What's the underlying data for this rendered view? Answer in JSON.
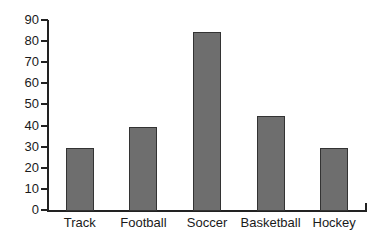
{
  "chart_data": {
    "type": "bar",
    "title": "",
    "subtitle": "",
    "xlabel": "",
    "ylabel": "",
    "categories": [
      "Track",
      "Football",
      "Soccer",
      "Basketball",
      "Hockey"
    ],
    "values": [
      30,
      40,
      85,
      45,
      30
    ],
    "ylim": [
      0,
      90
    ],
    "y_ticks": [
      0,
      10,
      20,
      30,
      40,
      50,
      60,
      70,
      80,
      90
    ],
    "y_tick_labels": [
      "0",
      "10",
      "20",
      "30",
      "40",
      "50",
      "60",
      "70",
      "80",
      "90"
    ],
    "grid": false,
    "legend": false,
    "legend_position": "none",
    "annotations": [],
    "colors": {
      "bar_fill": "#6e6e6e",
      "bar_border": "#333333",
      "axis": "#222222",
      "text": "#1a1a1a",
      "background": "#ffffff"
    }
  }
}
